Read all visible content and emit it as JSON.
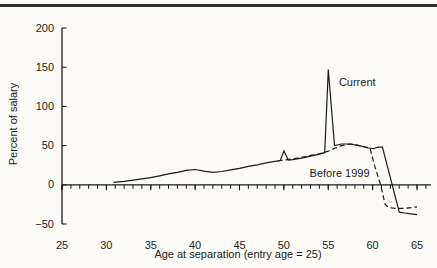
{
  "figure": {
    "background": "#fcfbf7",
    "ink": "#1c1c1c",
    "top_rule_color": "#2f2f2f"
  },
  "chart_data": {
    "type": "line",
    "title": "",
    "xlabel": "Age at separation (entry age = 25)",
    "ylabel": "Percent of salary",
    "xlim": [
      25,
      65
    ],
    "ylim": [
      -50,
      200
    ],
    "x_major_ticks": [
      25,
      30,
      35,
      40,
      45,
      50,
      55,
      60,
      65
    ],
    "x_minor_tick_step": 1,
    "x_minor_tick_end": 66,
    "y_ticks": [
      200,
      150,
      100,
      50,
      0,
      -50
    ],
    "grid": false,
    "legend_position": "inline-annotations",
    "series": [
      {
        "name": "Current",
        "style": "solid",
        "points": [
          [
            30.8,
            3
          ],
          [
            32,
            4.5
          ],
          [
            33,
            6
          ],
          [
            34,
            7.5
          ],
          [
            35,
            9
          ],
          [
            36,
            11.5
          ],
          [
            37,
            14
          ],
          [
            38,
            16
          ],
          [
            39,
            18.5
          ],
          [
            40,
            19.5
          ],
          [
            41,
            17.5
          ],
          [
            42,
            16
          ],
          [
            43,
            17
          ],
          [
            44,
            19
          ],
          [
            45,
            21
          ],
          [
            46,
            23.5
          ],
          [
            47,
            25.5
          ],
          [
            48,
            28
          ],
          [
            49,
            30
          ],
          [
            49.6,
            31
          ],
          [
            50,
            43
          ],
          [
            50.5,
            31.5
          ],
          [
            51,
            32
          ],
          [
            52,
            34
          ],
          [
            53,
            36.5
          ],
          [
            54,
            39
          ],
          [
            54.6,
            41
          ],
          [
            55,
            147
          ],
          [
            55.7,
            50
          ],
          [
            56.5,
            52
          ],
          [
            57.5,
            52
          ],
          [
            58.5,
            50
          ],
          [
            59.5,
            47
          ],
          [
            60.1,
            46
          ],
          [
            60.6,
            48
          ],
          [
            61.1,
            48
          ],
          [
            63,
            -35
          ],
          [
            63.6,
            -36
          ],
          [
            64.3,
            -37
          ],
          [
            65,
            -38
          ]
        ]
      },
      {
        "name": "Before 1999",
        "style": "dashed",
        "points": [
          [
            49.3,
            30.5
          ],
          [
            50,
            31.5
          ],
          [
            51,
            33
          ],
          [
            52,
            35
          ],
          [
            53,
            37.5
          ],
          [
            54,
            39.5
          ],
          [
            55,
            43
          ],
          [
            55.8,
            47
          ],
          [
            56.5,
            50
          ],
          [
            57.5,
            52
          ],
          [
            58.5,
            50
          ],
          [
            59.7,
            47
          ],
          [
            60.2,
            25
          ],
          [
            60.9,
            0
          ],
          [
            61.4,
            -25
          ],
          [
            61.8,
            -29
          ],
          [
            62.5,
            -30
          ],
          [
            63.5,
            -30
          ],
          [
            64.5,
            -29
          ],
          [
            65,
            -28
          ]
        ]
      }
    ],
    "annotations": [
      {
        "text": "Current",
        "series": "Current",
        "x": 56.2,
        "y": 126
      },
      {
        "text": "Before 1999",
        "series": "Before 1999",
        "x": 52.9,
        "y": 10
      }
    ]
  }
}
